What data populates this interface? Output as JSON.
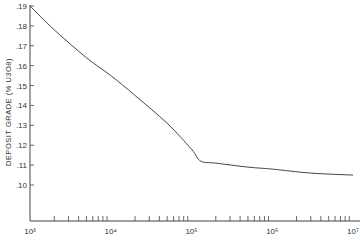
{
  "chart_data": {
    "type": "line",
    "title": "",
    "xlabel": "",
    "ylabel": "DEPOSIT GRADE (% U3O8)",
    "x_scale": "log",
    "xlim": [
      1000,
      10000000
    ],
    "ylim": [
      0.09,
      0.19
    ],
    "grid": false,
    "legend": null,
    "x_tick_labels": [
      "10³",
      "10⁴",
      "10⁵",
      "10⁶",
      "10⁷"
    ],
    "x_tick_values": [
      1000,
      10000,
      100000,
      1000000,
      10000000
    ],
    "y_tick_labels": [
      ".19",
      ".18",
      ".17",
      ".16",
      ".15",
      ".14",
      ".13",
      ".12",
      ".11",
      ".10"
    ],
    "y_tick_values": [
      0.19,
      0.18,
      0.17,
      0.16,
      0.15,
      0.14,
      0.13,
      0.12,
      0.11,
      0.1
    ],
    "series": [
      {
        "name": "Deposit grade",
        "x": [
          1000,
          2000,
          5000,
          10000,
          20000,
          50000,
          100000,
          130000,
          200000,
          500000,
          1000000,
          3000000,
          10000000
        ],
        "values": [
          0.19,
          0.178,
          0.164,
          0.155,
          0.145,
          0.131,
          0.118,
          0.112,
          0.111,
          0.109,
          0.108,
          0.106,
          0.105
        ]
      }
    ]
  }
}
